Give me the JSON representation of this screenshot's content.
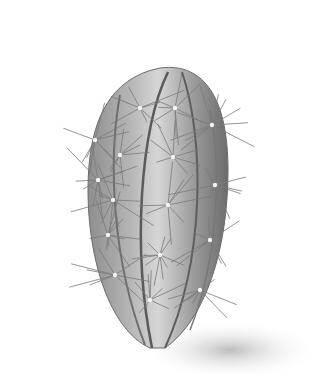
{
  "image": {
    "subject": "Pencil illustration of a columnar ribbed cactus with long radiating spines",
    "style": "graphite stipple drawing, grayscale",
    "colors": {
      "background": "#ffffff",
      "body_light": "#d8d8d8",
      "body_mid": "#a6a6a6",
      "body_dark": "#5e5e5e",
      "spine": "#7a7a7a",
      "areole": "#f4f4f4",
      "shadow": "#c9c9c9"
    }
  }
}
